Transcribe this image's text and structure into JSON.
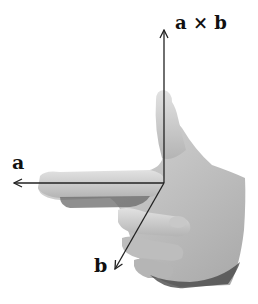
{
  "labels": {
    "a": "a",
    "b": "b",
    "axb": "a × b"
  },
  "vectors": [
    {
      "name": "a",
      "direction": "left (index finger)"
    },
    {
      "name": "b",
      "direction": "down-left (middle finger)"
    },
    {
      "name": "a × b",
      "direction": "up (thumb)"
    }
  ],
  "colors": {
    "arrow": "#222222",
    "skin_light": "#d4d4d4",
    "skin_mid": "#b0b0b0",
    "skin_dark": "#555555",
    "background": "#ffffff"
  }
}
